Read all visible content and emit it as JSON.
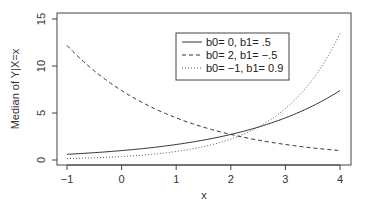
{
  "chart_data": {
    "type": "line",
    "title": "",
    "xlabel": "x",
    "ylabel": "Median of Y|X=x",
    "xlim": [
      -1,
      4
    ],
    "ylim": [
      0,
      15
    ],
    "x_ticks": [
      -1,
      0,
      1,
      2,
      3,
      4
    ],
    "y_ticks": [
      0,
      5,
      10,
      15
    ],
    "grid": false,
    "legend_position": "top-center",
    "function": "exp(b0 + b1*x)",
    "series": [
      {
        "name": "b0= 0,  b1=  .5",
        "b0": 0,
        "b1": 0.5,
        "style": "solid",
        "color": "#333333",
        "x": [
          -1,
          0,
          1,
          2,
          3,
          4
        ],
        "values": [
          0.61,
          1.0,
          1.65,
          2.72,
          4.48,
          7.39
        ]
      },
      {
        "name": "b0= 2,  b1= −.5",
        "b0": 2,
        "b1": -0.5,
        "style": "dashed",
        "color": "#333333",
        "x": [
          -1,
          0,
          1,
          2,
          3,
          4
        ],
        "values": [
          12.18,
          7.39,
          4.48,
          2.72,
          1.65,
          1.0
        ]
      },
      {
        "name": "b0= −1,  b1=  0.9",
        "b0": -1,
        "b1": 0.9,
        "style": "dotted",
        "color": "#555555",
        "x": [
          -1,
          0,
          1,
          2,
          3,
          4
        ],
        "values": [
          0.15,
          0.37,
          0.9,
          2.23,
          5.47,
          13.46
        ]
      }
    ]
  }
}
